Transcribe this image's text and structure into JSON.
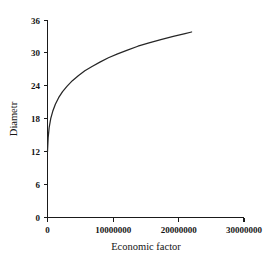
{
  "chart_data": {
    "type": "line",
    "title": "",
    "xlabel": "Economic factor",
    "ylabel": "Diametr",
    "xlim": [
      0,
      30000000
    ],
    "ylim": [
      0,
      36
    ],
    "xticks": [
      0,
      10000000,
      20000000,
      30000000
    ],
    "xticklabels": [
      "0",
      "10000000",
      "20000000",
      "30000000"
    ],
    "yticks": [
      0,
      6,
      12,
      18,
      24,
      30,
      36
    ],
    "yticklabels": [
      "0",
      "6",
      "12",
      "18",
      "24",
      "30",
      "36"
    ],
    "grid": false,
    "legend": false,
    "series": [
      {
        "name": "Diametr vs Economic factor",
        "color": "#262626",
        "x": [
          0,
          100000,
          250000,
          500000,
          800000,
          1200000,
          1700000,
          2300000,
          3000000,
          3800000,
          4700000,
          5700000,
          6800000,
          8000000,
          9300000,
          10700000,
          12200000,
          13800000,
          15500000,
          17300000,
          19200000,
          21000000,
          22000000
        ],
        "y": [
          12.0,
          14.6,
          16.4,
          18.1,
          19.4,
          20.7,
          21.9,
          23.0,
          24.0,
          25.0,
          25.9,
          26.8,
          27.6,
          28.4,
          29.2,
          29.9,
          30.6,
          31.3,
          31.9,
          32.5,
          33.1,
          33.6,
          33.9
        ]
      }
    ]
  },
  "axis_titles": {
    "x": "Economic factor",
    "y": "Diametr"
  }
}
